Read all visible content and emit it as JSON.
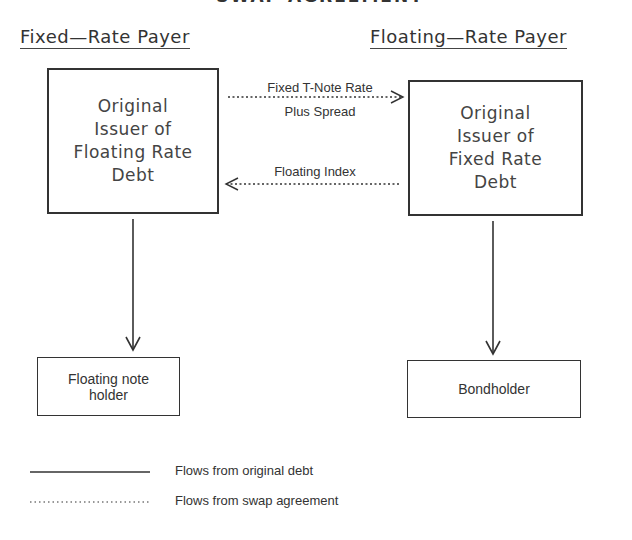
{
  "diagram": {
    "title_partial": "SWAP AGREEMENT",
    "parties": {
      "left": "Fixed—Rate Payer",
      "right": "Floating—Rate Payer"
    },
    "boxes": {
      "left_issuer": [
        "Original",
        "Issuer of",
        "Floating Rate",
        "Debt"
      ],
      "right_issuer": [
        "Original",
        "Issuer of",
        "Fixed Rate",
        "Debt"
      ],
      "left_holder": [
        "Floating note",
        "holder"
      ],
      "right_holder": "Bondholder"
    },
    "swap_flows": {
      "to_right_line1": "Fixed T-Note Rate",
      "to_right_line2": "Plus Spread",
      "to_left": "Floating Index"
    },
    "legend": [
      {
        "style": "solid",
        "label": "Flows from original debt"
      },
      {
        "style": "dotted",
        "label": "Flows from swap agreement"
      }
    ],
    "colors": {
      "line": "#333333",
      "background": "#ffffff"
    }
  }
}
